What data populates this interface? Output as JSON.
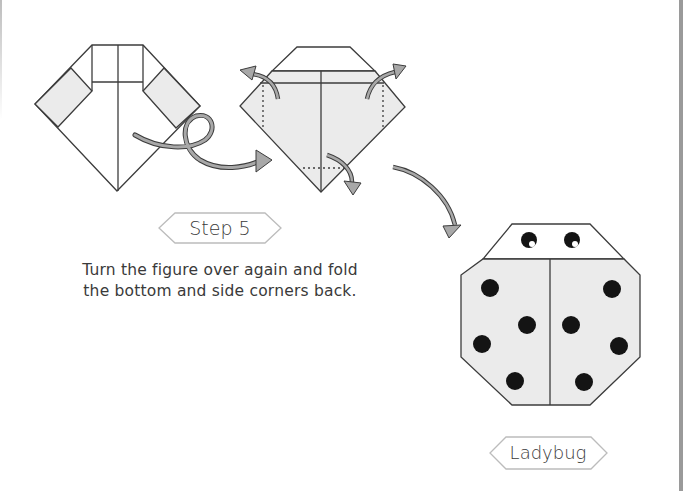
{
  "step": {
    "label": "Step 5",
    "instructions": [
      "Turn the figure over again and fold",
      "the bottom and side corners back."
    ]
  },
  "final": {
    "label": "Ladybug"
  },
  "figures": [
    {
      "id": "fold-before",
      "description": "diamond with shaded side flaps and top square"
    },
    {
      "id": "fold-after",
      "description": "shaded diamond with trapezoid top, dotted fold lines and fold-back arrows"
    },
    {
      "id": "ladybug",
      "description": "octagon ladybug with two eyes and eight spots"
    }
  ],
  "colors": {
    "line": "#3c3c3c",
    "paper_shaded": "#ebebeb",
    "paper_white": "#ffffff",
    "arrow_fill": "#a8a8a8",
    "spot": "#141414",
    "label_border": "#bcbcbc",
    "text": "#3a3a3a"
  }
}
